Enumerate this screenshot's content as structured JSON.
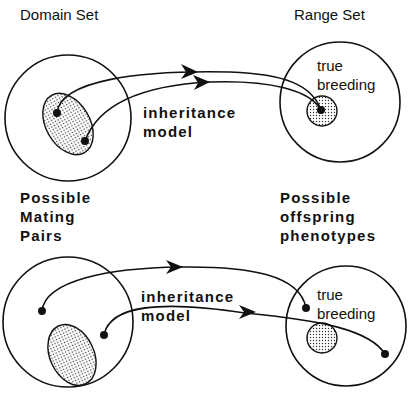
{
  "titles": {
    "domain": "Domain Set",
    "range": "Range Set"
  },
  "top_diagram": {
    "model_line1": "inheritance",
    "model_line2": "model",
    "true_line1": "true",
    "true_line2": "breeding"
  },
  "side_labels": {
    "left": [
      "Possible",
      "Mating",
      "Pairs"
    ],
    "right": [
      "Possible",
      "offspring",
      "phenotypes"
    ]
  },
  "bottom_diagram": {
    "model_line1": "inheritance",
    "model_line2": "model",
    "true_line1": "true",
    "true_line2": "breeding"
  },
  "colors": {
    "ink": "#111111",
    "background": "#ffffff"
  }
}
